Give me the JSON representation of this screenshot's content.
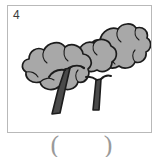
{
  "page": {
    "background_color": "#ffffff",
    "width": 163,
    "height": 157
  },
  "card": {
    "number_label": "4",
    "border_color": "#b9b9b9",
    "fill_color": "#ffffff"
  },
  "illustration": {
    "name": "two-trees-drawing",
    "subject": "two leafy broadleaf trees",
    "style": "grayscale line art, clip-art",
    "outline_color": "#1c1c1c",
    "canopy_fill_color": "#a8a8a8",
    "canopy_shadow_color": "#9a9a9a",
    "trunk_fill_color": "#4a4a4a",
    "trunk_outline_color": "#1c1c1c",
    "parts": [
      {
        "name": "back-right-canopy",
        "description": "upper right bushy crown"
      },
      {
        "name": "front-left-canopy",
        "description": "lower left bushy crown"
      },
      {
        "name": "left-trunk",
        "description": "thick slanted trunk with a branch fork"
      },
      {
        "name": "right-trunk",
        "description": "thin slanted trunk"
      }
    ]
  },
  "answer": {
    "open_paren": "(",
    "close_paren": ")",
    "value": "",
    "paren_color": "#9a9a9a"
  }
}
